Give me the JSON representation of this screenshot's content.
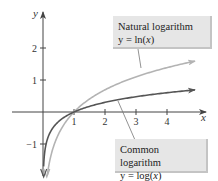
{
  "chart_data": {
    "type": "line",
    "title": "",
    "xlabel": "x",
    "ylabel": "y",
    "xlim": [
      -1,
      5.2
    ],
    "ylim": [
      -2,
      3
    ],
    "grid": false,
    "x_ticks": [
      1,
      2,
      3,
      4
    ],
    "x_tick_labels": [
      "1",
      "2",
      "3",
      "4"
    ],
    "y_ticks": [
      -1,
      1,
      2
    ],
    "y_tick_labels": [
      "−1",
      "1",
      "2"
    ],
    "series": [
      {
        "name": "Natural logarithm",
        "equation": "y = ln(x)",
        "function": "ln",
        "x_range": [
          0.12,
          4.9
        ],
        "color": "#b3b3b3",
        "points": [
          [
            0.15,
            -1.9
          ],
          [
            0.25,
            -1.39
          ],
          [
            0.5,
            -0.69
          ],
          [
            1,
            0
          ],
          [
            2,
            0.69
          ],
          [
            3,
            1.1
          ],
          [
            4,
            1.39
          ],
          [
            4.9,
            1.59
          ]
        ]
      },
      {
        "name": "Common logarithm",
        "equation": "y = log(x)",
        "function": "log10",
        "x_range": [
          0.02,
          4.9
        ],
        "color": "#555555",
        "points": [
          [
            0.02,
            -1.7
          ],
          [
            0.1,
            -1.0
          ],
          [
            0.5,
            -0.3
          ],
          [
            1,
            0
          ],
          [
            2,
            0.3
          ],
          [
            3,
            0.48
          ],
          [
            4,
            0.6
          ],
          [
            4.9,
            0.69
          ]
        ]
      }
    ],
    "annotations": [
      {
        "title": "Natural logarithm",
        "equation_prefix": "y = ",
        "equation_fn": "ln(",
        "equation_var": "x",
        "equation_suffix": ")",
        "points_to": "Natural logarithm",
        "anchor_x": 3.1
      },
      {
        "title": "Common logarithm",
        "equation_prefix": "y = ",
        "equation_fn": "log(",
        "equation_var": "x",
        "equation_suffix": ")",
        "points_to": "Common logarithm",
        "anchor_x": 2.4
      }
    ]
  }
}
